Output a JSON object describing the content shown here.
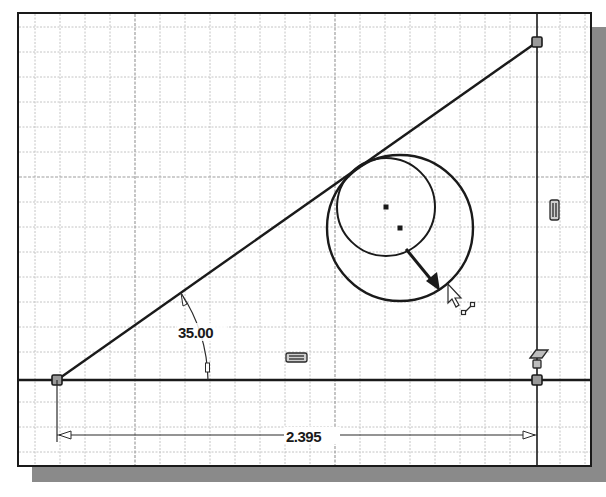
{
  "sketch": {
    "title": "2D sketch - tangent circle on inclined line",
    "grid": {
      "spacing_px": 25,
      "major_every": 8,
      "minor_color": "#bdbdbd",
      "major_color": "#9a9a9a"
    },
    "line_color": "#1a1a1a",
    "dimensions": {
      "angle": {
        "value": "35.00",
        "unit": "deg"
      },
      "horizontal": {
        "value": "2.395"
      }
    },
    "constraints": {
      "vertical_icon": "vertical-constraint-icon",
      "horizontal_icon": "horizontal-constraint-icon",
      "coincident_icon": "coincident-constraint-icon"
    },
    "entities": {
      "baseline": "horizontal line",
      "inclined_line": "inclined line at 35.00 degrees",
      "vertical_line": "vertical line",
      "circle_small": "tangent circle (original)",
      "circle_large": "tangent circle (being resized)",
      "drag_arrow": "resize direction arrow",
      "cursor": "mouse pointer with resize glyph"
    }
  }
}
